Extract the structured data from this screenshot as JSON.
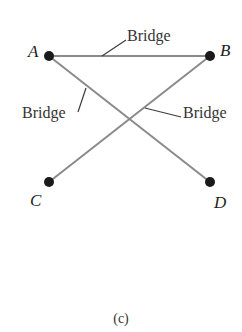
{
  "diagram": {
    "nodes": [
      {
        "id": "A",
        "label": "A"
      },
      {
        "id": "B",
        "label": "B"
      },
      {
        "id": "C",
        "label": "C"
      },
      {
        "id": "D",
        "label": "D"
      }
    ],
    "edges": [
      {
        "from": "A",
        "to": "B",
        "label": "Bridge"
      },
      {
        "from": "A",
        "to": "D",
        "label": "Bridge"
      },
      {
        "from": "B",
        "to": "C",
        "label": "Bridge"
      }
    ],
    "caption": "(c)"
  },
  "colors": {
    "edge": "#8a8a8a",
    "node": "#1a1a1a",
    "text": "#222222"
  }
}
